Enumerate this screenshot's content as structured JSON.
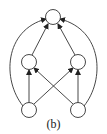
{
  "diagram": {
    "caption": "(b)",
    "nodes": [
      {
        "id": "top",
        "x": 53,
        "y": 17
      },
      {
        "id": "mid-left",
        "x": 29,
        "y": 62
      },
      {
        "id": "mid-right",
        "x": 78,
        "y": 62
      },
      {
        "id": "bottom-left",
        "x": 29,
        "y": 110
      },
      {
        "id": "bottom-right",
        "x": 78,
        "y": 110
      }
    ],
    "edges": [
      {
        "from": "mid-left",
        "to": "top"
      },
      {
        "from": "mid-right",
        "to": "top"
      },
      {
        "from": "bottom-left",
        "to": "top",
        "curved": true
      },
      {
        "from": "bottom-right",
        "to": "top",
        "curved": true
      },
      {
        "from": "bottom-left",
        "to": "mid-left"
      },
      {
        "from": "bottom-right",
        "to": "mid-right"
      },
      {
        "from": "bottom-left",
        "to": "mid-right"
      },
      {
        "from": "bottom-right",
        "to": "mid-left"
      }
    ]
  }
}
